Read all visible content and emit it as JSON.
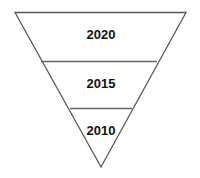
{
  "diagram": {
    "type": "inverted-pyramid",
    "stroke_color": "#555555",
    "levels": [
      {
        "label": "2020"
      },
      {
        "label": "2015"
      },
      {
        "label": "2010"
      }
    ]
  }
}
